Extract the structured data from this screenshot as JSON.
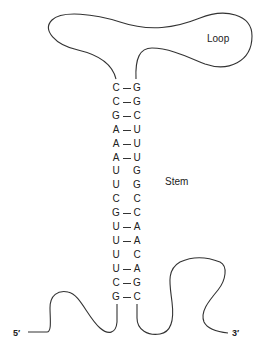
{
  "labels": {
    "loop": "Loop",
    "stem": "Stem",
    "five_prime": "5′",
    "three_prime": "3′"
  },
  "stem_pairs": [
    {
      "left": "C",
      "right": "G",
      "paired": true
    },
    {
      "left": "C",
      "right": "G",
      "paired": true
    },
    {
      "left": "G",
      "right": "C",
      "paired": true
    },
    {
      "left": "A",
      "right": "U",
      "paired": true
    },
    {
      "left": "A",
      "right": "U",
      "paired": true
    },
    {
      "left": "A",
      "right": "U",
      "paired": true
    },
    {
      "left": "U",
      "right": "G",
      "paired": false
    },
    {
      "left": "U",
      "right": "G",
      "paired": false
    },
    {
      "left": "C",
      "right": "C",
      "paired": false
    },
    {
      "left": "G",
      "right": "C",
      "paired": true
    },
    {
      "left": "U",
      "right": "A",
      "paired": true
    },
    {
      "left": "U",
      "right": "A",
      "paired": true
    },
    {
      "left": "U",
      "right": "C",
      "paired": false
    },
    {
      "left": "U",
      "right": "A",
      "paired": true
    },
    {
      "left": "C",
      "right": "G",
      "paired": true
    },
    {
      "left": "G",
      "right": "C",
      "paired": true
    }
  ],
  "colors": {
    "line": "#333333",
    "text": "#222222",
    "background": "#ffffff"
  }
}
